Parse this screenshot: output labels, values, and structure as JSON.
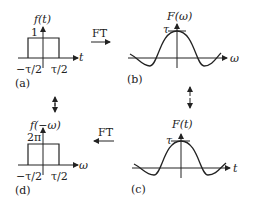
{
  "panels": {
    "a": {
      "caption": "(a)",
      "func_label": "f(t)",
      "height_label": "1",
      "axis_label": "t",
      "left_tick": "−τ/2",
      "right_tick": "τ/2"
    },
    "b": {
      "caption": "(b)",
      "func_label": "F(ω)",
      "peak_label": "τ",
      "axis_label": "ω"
    },
    "c": {
      "caption": "(c)",
      "func_label": "F(t)",
      "peak_label": "τ",
      "axis_label": "t"
    },
    "d": {
      "caption": "(d)",
      "func_label": "f(−ω)",
      "height_label": "2π",
      "axis_label": "ω",
      "left_tick": "−τ/2",
      "right_tick": "τ/2"
    }
  },
  "arrows": {
    "top": {
      "label": "FT",
      "direction": "right"
    },
    "bottom": {
      "label": "FT",
      "direction": "left"
    }
  }
}
